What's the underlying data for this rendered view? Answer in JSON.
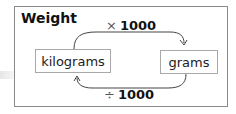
{
  "title": "Weight",
  "nodes": {
    "left": "kilograms",
    "right": "grams"
  },
  "edges": {
    "forward": {
      "operator": "×",
      "value": "1000"
    },
    "backward": {
      "operator": "÷",
      "value": "1000"
    }
  },
  "colors": {
    "border": "#8a8a8a",
    "box_border": "#a9a9a9",
    "arrow": "#444444",
    "text": "#111111"
  }
}
